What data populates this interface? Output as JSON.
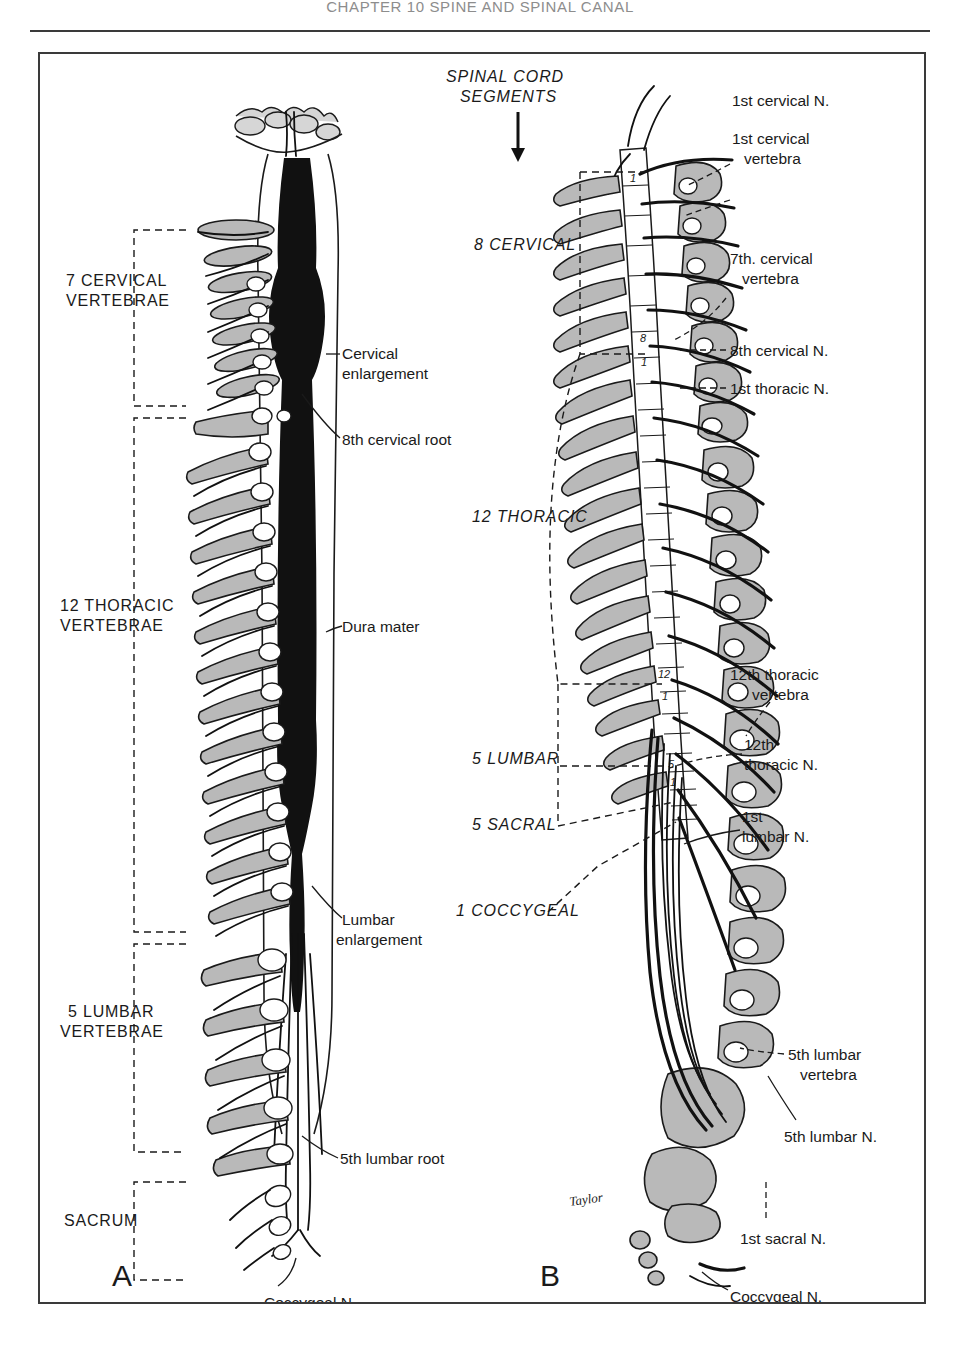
{
  "running_head": "CHAPTER 10 SPINE AND SPINAL CANAL",
  "figure": {
    "panel_a": {
      "letter": "A",
      "bracket_labels": [
        {
          "line1": "7 CERVICAL",
          "line2": "VERTEBRAE"
        },
        {
          "line1": "12 THORACIC",
          "line2": "VERTEBRAE"
        },
        {
          "line1": "5 LUMBAR",
          "line2": "VERTEBRAE"
        },
        {
          "line1": "SACRUM",
          "line2": ""
        }
      ],
      "callouts": [
        {
          "line1": "Cervical",
          "line2": "enlargement"
        },
        {
          "line1": "8th cervical root",
          "line2": ""
        },
        {
          "line1": "Dura mater",
          "line2": ""
        },
        {
          "line1": "Lumbar",
          "line2": "enlargement"
        },
        {
          "line1": "5th lumbar root",
          "line2": ""
        },
        {
          "line1": "Coccygeal N.",
          "line2": ""
        }
      ]
    },
    "panel_b": {
      "letter": "B",
      "title_line1": "SPINAL CORD",
      "title_line2": "SEGMENTS",
      "segment_groups": [
        "8 CERVICAL",
        "12 THORACIC",
        "5 LUMBAR",
        "5 SACRAL",
        "1 COCCYGEAL"
      ],
      "segment_numbers": [
        "1",
        "8",
        "1",
        "12",
        "1",
        "5",
        "1"
      ],
      "callouts": [
        {
          "line1": "1st cervical N.",
          "line2": ""
        },
        {
          "line1": "1st cervical",
          "line2": "vertebra"
        },
        {
          "line1": "7th. cervical",
          "line2": "vertebra"
        },
        {
          "line1": "8th cervical N.",
          "line2": ""
        },
        {
          "line1": "1st thoracic N.",
          "line2": ""
        },
        {
          "line1": "12th thoracic",
          "line2": "vertebra"
        },
        {
          "line1": "12th",
          "line2": "thoracic N."
        },
        {
          "line1": "1st",
          "line2": "lumbar N."
        },
        {
          "line1": "5th lumbar",
          "line2": "vertebra"
        },
        {
          "line1": "5th lumbar N.",
          "line2": ""
        },
        {
          "line1": "1st sacral N.",
          "line2": ""
        },
        {
          "line1": "Coccygeal N.",
          "line2": ""
        }
      ],
      "artist_signature": "Taylor"
    }
  },
  "colors": {
    "ink": "#1a1a1a",
    "bone_fill": "#b9b9b9",
    "bone_fill_light": "#d6d6d6",
    "paper": "#ffffff",
    "running_head": "#8d8d8d"
  }
}
